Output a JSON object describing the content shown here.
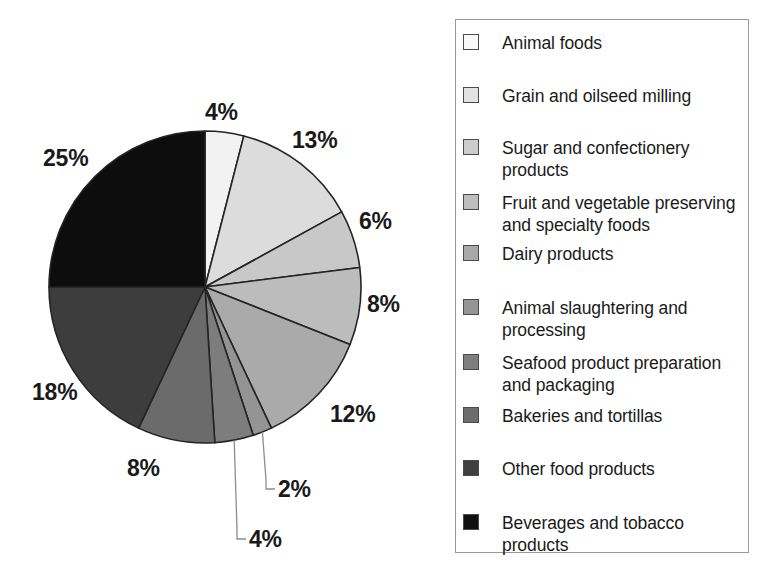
{
  "chart_data": {
    "type": "pie",
    "title": "",
    "subtitle": "",
    "xlabel": "",
    "ylabel": "",
    "legend_position": "right",
    "grid": false,
    "unit": "%",
    "start_angle_deg": 0,
    "direction": "clockwise",
    "categories": [
      "Animal foods",
      "Grain and oilseed milling",
      "Sugar and confectionery products",
      "Fruit and vegetable preserving and specialty foods",
      "Dairy products",
      "Animal slaughtering and processing",
      "Seafood product preparation and packaging",
      "Bakeries and tortillas",
      "Other food products",
      "Beverages and tobacco products"
    ],
    "values": [
      4,
      13,
      6,
      8,
      12,
      2,
      4,
      8,
      18,
      25
    ],
    "value_labels": [
      "4%",
      "13%",
      "6%",
      "8%",
      "12%",
      "2%",
      "4%",
      "8%",
      "18%",
      "25%"
    ],
    "colors": [
      "#f2f2f2",
      "#dcdcdc",
      "#c8c8c8",
      "#bcbcbc",
      "#aaaaaa",
      "#949494",
      "#7d7d7d",
      "#6b6b6b",
      "#3d3d3d",
      "#0d0d0d"
    ]
  },
  "pie": {
    "center_x": 205,
    "center_y": 287,
    "radius": 156,
    "slices": [
      {
        "name": "animal-foods",
        "label": "4%",
        "value": 4,
        "color": "#f2f2f2",
        "label_x": 205,
        "label_y": 101,
        "leader": false
      },
      {
        "name": "grain-and-oilseed-milling",
        "label": "13%",
        "value": 13,
        "color": "#dcdcdc",
        "label_x": 292,
        "label_y": 129,
        "leader": false
      },
      {
        "name": "sugar-and-confectionery",
        "label": "6%",
        "value": 6,
        "color": "#c8c8c8",
        "label_x": 359,
        "label_y": 210,
        "leader": false
      },
      {
        "name": "fruit-and-vegetable",
        "label": "8%",
        "value": 8,
        "color": "#bcbcbc",
        "label_x": 367,
        "label_y": 293,
        "leader": false
      },
      {
        "name": "dairy-products",
        "label": "12%",
        "value": 12,
        "color": "#aaaaaa",
        "label_x": 330,
        "label_y": 403,
        "leader": false
      },
      {
        "name": "animal-slaughtering",
        "label": "2%",
        "value": 2,
        "color": "#949494",
        "label_x": 278,
        "label_y": 478,
        "leader": true
      },
      {
        "name": "seafood-product",
        "label": "4%",
        "value": 4,
        "color": "#7d7d7d",
        "label_x": 249,
        "label_y": 528,
        "leader": true
      },
      {
        "name": "bakeries-and-tortillas",
        "label": "8%",
        "value": 8,
        "color": "#6b6b6b",
        "label_x": 127,
        "label_y": 457,
        "leader": false
      },
      {
        "name": "other-food-products",
        "label": "18%",
        "value": 18,
        "color": "#3d3d3d",
        "label_x": 32,
        "label_y": 381,
        "leader": false
      },
      {
        "name": "beverages-and-tobacco",
        "label": "25%",
        "value": 25,
        "color": "#0d0d0d",
        "label_x": 43,
        "label_y": 147,
        "leader": false
      }
    ]
  },
  "legend": {
    "items": [
      {
        "label": "Animal foods",
        "color": "#f8f8f8",
        "y": 31
      },
      {
        "label": "Grain and oilseed milling",
        "color": "#e2e2e2",
        "y": 84
      },
      {
        "label": "Sugar and confectionery\nproducts",
        "color": "#cccccc",
        "y": 136
      },
      {
        "label": "Fruit and vegetable preserving\nand specialty foods",
        "color": "#bdbdbd",
        "y": 191
      },
      {
        "label": "Dairy products",
        "color": "#a8a8a8",
        "y": 242
      },
      {
        "label": "Animal slaughtering and\nprocessing",
        "color": "#959595",
        "y": 296
      },
      {
        "label": "Seafood product preparation\nand packaging",
        "color": "#7e7e7e",
        "y": 351
      },
      {
        "label": "Bakeries and tortillas",
        "color": "#6d6d6d",
        "y": 404
      },
      {
        "label": "Other food products",
        "color": "#3f3f3f",
        "y": 457
      },
      {
        "label": "Beverages and tobacco\nproducts",
        "color": "#101010",
        "y": 511
      }
    ]
  }
}
